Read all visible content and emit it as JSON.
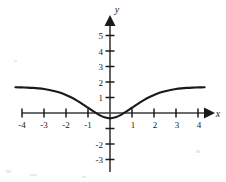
{
  "figure": {
    "name": "cartesian-plot",
    "background_color": "#ffffff",
    "ink_color": "#1a1a1a",
    "axis_color": "#3a3a3a"
  },
  "axes": {
    "x_axis_label": "x",
    "y_axis_label": "y",
    "x_tick_labels": [
      "-4",
      "-3",
      "-2",
      "-1",
      "1",
      "2",
      "3",
      "4"
    ],
    "y_tick_labels": [
      "5",
      "4",
      "3",
      "2",
      "1",
      "-2",
      "-3"
    ],
    "x_ticks": [
      -4,
      -3,
      -2,
      -1,
      1,
      2,
      3,
      4
    ],
    "y_ticks": [
      5,
      4,
      3,
      2,
      1,
      -1,
      -2,
      -3
    ],
    "y_unlabeled_ticks": [
      -1
    ]
  },
  "chart_data": {
    "type": "line",
    "title": "",
    "xlabel": "x",
    "ylabel": "y",
    "xlim": [
      -4.35,
      4.35
    ],
    "ylim": [
      -3.4,
      5.6
    ],
    "grid": false,
    "legend": null,
    "x_ticks": [
      -4,
      -3,
      -2,
      -1,
      1,
      2,
      3,
      4
    ],
    "y_ticks": [
      5,
      4,
      3,
      2,
      1,
      -2,
      -3
    ],
    "series": [
      {
        "name": "curve",
        "color": "#1a1a1a",
        "x": [
          -4.3,
          -4.0,
          -3.75,
          -3.5,
          -3.25,
          -3.0,
          -2.75,
          -2.5,
          -2.25,
          -2.0,
          -1.75,
          -1.5,
          -1.25,
          -1.0,
          -0.75,
          -0.5,
          -0.25,
          0.0,
          0.25,
          0.5,
          0.75,
          1.0,
          1.25,
          1.5,
          1.75,
          2.0,
          2.25,
          2.5,
          2.75,
          3.0,
          3.25,
          3.5,
          3.75,
          4.0,
          4.3
        ],
        "y": [
          1.66,
          1.65,
          1.64,
          1.62,
          1.59,
          1.55,
          1.49,
          1.41,
          1.3,
          1.16,
          1.0,
          0.8,
          0.58,
          0.34,
          0.1,
          -0.12,
          -0.28,
          -0.35,
          -0.28,
          -0.12,
          0.1,
          0.34,
          0.58,
          0.8,
          1.0,
          1.16,
          1.3,
          1.41,
          1.49,
          1.55,
          1.59,
          1.62,
          1.64,
          1.65,
          1.66
        ]
      }
    ],
    "annotations": {
      "minimum_y": -0.35,
      "minimum_x": 0,
      "x_intercepts": [
        -1,
        1
      ],
      "plateau_y": 1.65,
      "symmetry": "even"
    }
  }
}
